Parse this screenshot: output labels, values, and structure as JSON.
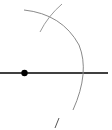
{
  "diagram": {
    "type": "geometric-construction",
    "width": 112,
    "height": 130,
    "background": "#ffffff",
    "colors": {
      "line": "#000000",
      "arc": "#8a8a8a",
      "point": "#000000"
    },
    "horizontal_line": {
      "x1": 0,
      "y1": 73,
      "x2": 108,
      "y2": 73
    },
    "point": {
      "cx": 24.5,
      "cy": 73,
      "r": 3.2
    },
    "main_arc": {
      "path": "M 24 10 Q 62 14 79 45 Q 90 72 73 110"
    },
    "crossing_arc": {
      "path": "M 40 32 Q 48 16 62 4"
    },
    "bottom_mark": {
      "path": "M 59 118 L 55 128"
    }
  }
}
